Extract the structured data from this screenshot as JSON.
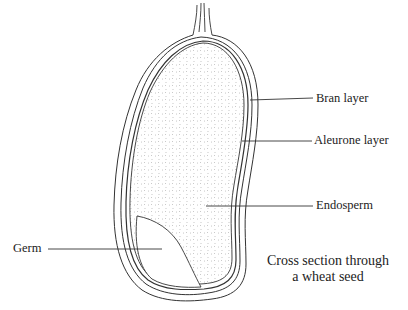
{
  "diagram": {
    "title": "Cross section through a wheat seed",
    "caption_lines": [
      "Cross section through",
      "a wheat seed"
    ],
    "labels": {
      "bran": "Bran layer",
      "aleurone": "Aleurone layer",
      "endosperm": "Endosperm",
      "germ": "Germ"
    },
    "colors": {
      "line": "#333333",
      "text": "#222222",
      "dots": "#888888",
      "background": "#ffffff"
    }
  }
}
